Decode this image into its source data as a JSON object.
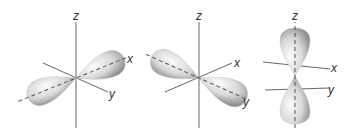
{
  "figure": {
    "colors": {
      "axis": "#555555",
      "lobe_light": "#f2f2f2",
      "lobe_dark": "#9a9a9a",
      "dash": "#555555",
      "label": "#333333"
    },
    "panels": [
      {
        "orbital": "px",
        "axis_labels": {
          "z": "z",
          "x": "x",
          "y": "y"
        }
      },
      {
        "orbital": "py",
        "axis_labels": {
          "z": "z",
          "x": "x",
          "y": "y"
        }
      },
      {
        "orbital": "pz",
        "axis_labels": {
          "z": "z",
          "x": "x",
          "y": "y"
        }
      }
    ]
  }
}
